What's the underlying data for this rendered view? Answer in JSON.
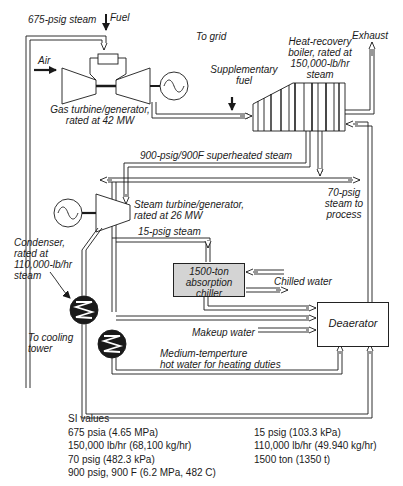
{
  "diagram": {
    "type": "process-flow",
    "components": {
      "gas_turbine": {
        "label_line1": "Gas turbine/generator,",
        "label_line2": "rated at 42 MW"
      },
      "hrsg": {
        "label_line1": "Heat-recovery",
        "label_line2": "boiler, rated at",
        "label_line3": "150,000-lb/hr",
        "label_line4": "steam"
      },
      "steam_turbine": {
        "label_line1": "Steam turbine/generator,",
        "label_line2": "rated at 26 MW"
      },
      "condenser": {
        "label_line1": "Condenser,",
        "label_line2": "rated at",
        "label_line3": "110,000-lb/hr",
        "label_line4": "steam"
      },
      "chiller": {
        "label_line1": "1500-ton",
        "label_line2": "absorption",
        "label_line3": "chiller"
      },
      "deaerator": {
        "label": "Deaerator"
      }
    },
    "streams": {
      "steam_675": "675-psig steam",
      "fuel": "Fuel",
      "air": "Air",
      "to_grid": "To grid",
      "exhaust": "Exhaust",
      "supplementary_fuel_line1": "Supplementary",
      "supplementary_fuel_line2": "fuel",
      "superheated": "900-psig/900F superheated steam",
      "process_line1": "70-psig",
      "process_line2": "steam to",
      "process_line3": "process",
      "steam_15": "15-psig steam",
      "chilled_water": "Chilled water",
      "makeup_water": "Makeup water",
      "cooling_line1": "To cooling",
      "cooling_line2": "tower",
      "hot_water_line1": "Medium-temperture",
      "hot_water_line2": "hot water for heating duties"
    },
    "edges": [
      {
        "from": "HRSG",
        "to": "gas turbine combustor",
        "label": "675-psig steam"
      },
      {
        "from": "Fuel",
        "to": "gas turbine combustor"
      },
      {
        "from": "Air",
        "to": "gas turbine compressor"
      },
      {
        "from": "gas turbine",
        "to": "HRSG",
        "label": "exhaust gas"
      },
      {
        "from": "Supplementary fuel",
        "to": "HRSG"
      },
      {
        "from": "HRSG",
        "to": "Exhaust"
      },
      {
        "from": "HRSG",
        "to": "steam turbine",
        "label": "900-psig/900F superheated steam"
      },
      {
        "from": "HRSG",
        "to": "process header",
        "label": "70-psig steam to process"
      },
      {
        "from": "steam turbine",
        "to": "absorption chiller",
        "label": "15-psig steam"
      },
      {
        "from": "steam turbine",
        "to": "condenser"
      },
      {
        "from": "chiller",
        "to": "Deaerator"
      },
      {
        "from": "Makeup water",
        "to": "Deaerator"
      },
      {
        "from": "hot water exchanger",
        "to": "Deaerator"
      },
      {
        "from": "condenser",
        "to": "Deaerator"
      },
      {
        "from": "Deaerator",
        "to": "HRSG",
        "label": "feedwater"
      }
    ]
  },
  "si_values": {
    "title": "SI values",
    "left": [
      "675 psia (4.65 MPa)",
      "150,000 lb/hr (68,100 kg/hr)",
      "70 psig (482.3 kPa)",
      "900 psig, 900 F (6.2 MPa, 482 C)"
    ],
    "right": [
      "15 psig (103.3 kPa)",
      "110,000 lb/hr (49.940 kg/hr)",
      "1500 ton (1350 t)"
    ]
  },
  "colors": {
    "line": "#1a1a1a",
    "chiller_fill": "#d4d4d4",
    "background": "#ffffff"
  }
}
